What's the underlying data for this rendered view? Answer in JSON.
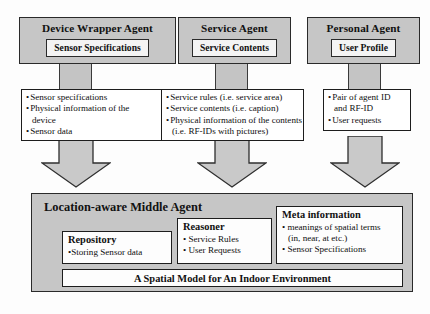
{
  "diagram": {
    "title_text": "Location-aware agent architecture diagram",
    "colors": {
      "agent_fill": "#c6c6c6",
      "agent_border": "#2a2a2a",
      "list_fill": "#ffffff",
      "list_border": "#1d1d1d",
      "arrow_fill": "#c9c9c9",
      "arrow_border": "#2f2f2f"
    }
  },
  "agents": [
    {
      "title": "Device Wrapper Agent",
      "sub": "Sensor Specifications",
      "items": [
        {
          "text": "Sensor specifications",
          "bullet": true
        },
        {
          "text": "Physical information of the",
          "bullet": true
        },
        {
          "text": "device",
          "bullet": false
        },
        {
          "text": "Sensor data",
          "bullet": true
        }
      ]
    },
    {
      "title": "Service Agent",
      "sub": "Service Contents",
      "items": [
        {
          "text": "Service rules (i.e. service area)",
          "bullet": true
        },
        {
          "text": "Service contents (i.e. caption)",
          "bullet": true
        },
        {
          "text": "Physical information of the contents",
          "bullet": true
        },
        {
          "text": "(i.e. RF-IDs with pictures)",
          "bullet": false
        }
      ]
    },
    {
      "title": "Personal Agent",
      "sub": "User Profile",
      "items": [
        {
          "text": "Pair of agent ID",
          "bullet": true
        },
        {
          "text": "and RF-ID",
          "bullet": false
        },
        {
          "text": "User requests",
          "bullet": true
        }
      ]
    }
  ],
  "middle": {
    "title": "Location-aware Middle Agent",
    "repository": {
      "head": "Repository",
      "items": [
        {
          "text": "•Storing Sensor data",
          "cont": false
        }
      ]
    },
    "reasoner": {
      "head": "Reasoner",
      "items": [
        {
          "text": "• Service Rules",
          "cont": false
        },
        {
          "text": "• User Requests",
          "cont": false
        }
      ]
    },
    "meta": {
      "head": "Meta information",
      "items": [
        {
          "text": "• meanings of spatial terms",
          "cont": false
        },
        {
          "text": "(in, near, at etc.)",
          "cont": true
        },
        {
          "text": "•  Sensor Specifications",
          "cont": false
        }
      ]
    },
    "spatial_model": "A Spatial Model for An Indoor Environment"
  }
}
